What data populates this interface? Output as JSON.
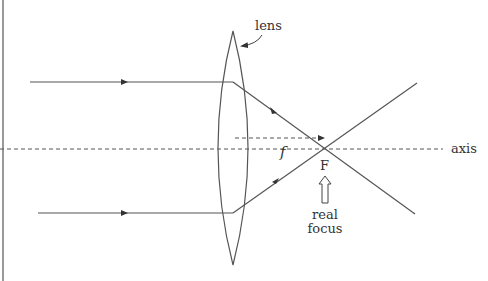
{
  "diagram": {
    "labels": {
      "lens": "lens",
      "focal_length": "f",
      "focus_point": "F",
      "axis": "axis",
      "real_focus_line1": "real",
      "real_focus_line2": "focus"
    },
    "colors": {
      "line": "#555555",
      "text": "#333333",
      "background": "#ffffff"
    }
  }
}
